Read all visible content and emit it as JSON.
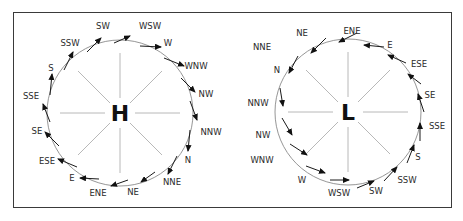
{
  "figure": {
    "high_pressure": {
      "center_label": "H",
      "rotation": "clockwise",
      "labels": [
        {
          "text": "SW",
          "x": 103,
          "y": 29
        },
        {
          "text": "WSW",
          "x": 150,
          "y": 29
        },
        {
          "text": "W",
          "x": 168,
          "y": 46
        },
        {
          "text": "WNW",
          "x": 196,
          "y": 69
        },
        {
          "text": "NW",
          "x": 206,
          "y": 97
        },
        {
          "text": "NNW",
          "x": 211,
          "y": 135
        },
        {
          "text": "N",
          "x": 188,
          "y": 163
        },
        {
          "text": "NNE",
          "x": 172,
          "y": 185
        },
        {
          "text": "NE",
          "x": 133,
          "y": 195
        },
        {
          "text": "ENE",
          "x": 98,
          "y": 196
        },
        {
          "text": "E",
          "x": 72,
          "y": 181
        },
        {
          "text": "ESE",
          "x": 47,
          "y": 164
        },
        {
          "text": "SE",
          "x": 37,
          "y": 134
        },
        {
          "text": "SSE",
          "x": 31,
          "y": 99
        },
        {
          "text": "S",
          "x": 51,
          "y": 71
        },
        {
          "text": "SSW",
          "x": 70,
          "y": 46
        }
      ]
    },
    "low_pressure": {
      "center_label": "L",
      "rotation": "counterclockwise",
      "labels": [
        {
          "text": "NE",
          "x": 302,
          "y": 36
        },
        {
          "text": "ENE",
          "x": 352,
          "y": 34
        },
        {
          "text": "E",
          "x": 390,
          "y": 48
        },
        {
          "text": "ESE",
          "x": 419,
          "y": 67
        },
        {
          "text": "SE",
          "x": 430,
          "y": 98
        },
        {
          "text": "SSE",
          "x": 437,
          "y": 129
        },
        {
          "text": "S",
          "x": 418,
          "y": 160
        },
        {
          "text": "SSW",
          "x": 407,
          "y": 183
        },
        {
          "text": "SW",
          "x": 376,
          "y": 194
        },
        {
          "text": "WSW",
          "x": 339,
          "y": 196
        },
        {
          "text": "W",
          "x": 302,
          "y": 183
        },
        {
          "text": "WNW",
          "x": 262,
          "y": 163
        },
        {
          "text": "NW",
          "x": 263,
          "y": 138
        },
        {
          "text": "NNW",
          "x": 258,
          "y": 106
        },
        {
          "text": "N",
          "x": 277,
          "y": 73
        },
        {
          "text": "NNE",
          "x": 262,
          "y": 50
        }
      ]
    }
  }
}
